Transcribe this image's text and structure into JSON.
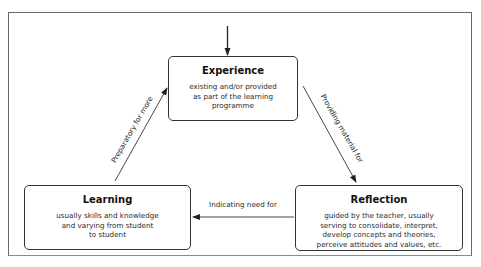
{
  "diagram": {
    "type": "cycle",
    "nodes": [
      {
        "id": "experience",
        "title": "Experience",
        "description": "existing and/or provided\nas part of the learning\nprogramme"
      },
      {
        "id": "reflection",
        "title": "Reflection",
        "description": "guided by the teacher, usually\nserving to consolidate, interpret,\ndevelop concepts and theories,\nperceive attitudes and values, etc."
      },
      {
        "id": "learning",
        "title": "Learning",
        "description": "usually skills and knowledge\nand varying from student\nto student"
      }
    ],
    "edges": [
      {
        "from": "entry",
        "to": "experience",
        "label": ""
      },
      {
        "from": "experience",
        "to": "reflection",
        "label": "Providing material for"
      },
      {
        "from": "reflection",
        "to": "learning",
        "label": "Indicating need for"
      },
      {
        "from": "learning",
        "to": "experience",
        "label": "Preparatory for more"
      }
    ]
  },
  "colors": {
    "stroke": "#333333",
    "frame": "#6a6a6a",
    "text": "#1a1a1a",
    "background": "#ffffff"
  }
}
